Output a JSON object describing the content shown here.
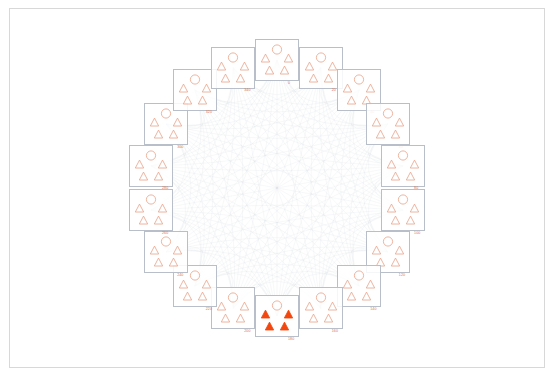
{
  "figure": {
    "title": "",
    "background_color": "#ffffff",
    "frame_color": "#d8d8d8",
    "edge_color": "#c9ced6",
    "node_border_color": "#b9bfc9",
    "glyph_outline_color": "#e8a288",
    "glyph_fill_color": "#f4460d",
    "label_color": "#e2704f",
    "layout": "circular",
    "node_count": 18,
    "glyphs_per_node": {
      "circles": 1,
      "triangles": 4
    }
  },
  "chart_data": {
    "type": "diagram",
    "nodes": [
      {
        "id": 0,
        "label": "0",
        "angle_deg": 0,
        "highlighted": false,
        "circles": 1,
        "triangles": 4,
        "filled_triangles": 0
      },
      {
        "id": 1,
        "label": "20",
        "angle_deg": 20,
        "highlighted": false,
        "circles": 1,
        "triangles": 4,
        "filled_triangles": 0
      },
      {
        "id": 2,
        "label": "40",
        "angle_deg": 40,
        "highlighted": false,
        "circles": 1,
        "triangles": 4,
        "filled_triangles": 0
      },
      {
        "id": 3,
        "label": "60",
        "angle_deg": 60,
        "highlighted": false,
        "circles": 1,
        "triangles": 4,
        "filled_triangles": 0
      },
      {
        "id": 4,
        "label": "80",
        "angle_deg": 80,
        "highlighted": false,
        "circles": 1,
        "triangles": 4,
        "filled_triangles": 0
      },
      {
        "id": 5,
        "label": "100",
        "angle_deg": 100,
        "highlighted": false,
        "circles": 1,
        "triangles": 4,
        "filled_triangles": 0
      },
      {
        "id": 6,
        "label": "120",
        "angle_deg": 120,
        "highlighted": false,
        "circles": 1,
        "triangles": 4,
        "filled_triangles": 0
      },
      {
        "id": 7,
        "label": "140",
        "angle_deg": 140,
        "highlighted": false,
        "circles": 1,
        "triangles": 4,
        "filled_triangles": 0
      },
      {
        "id": 8,
        "label": "160",
        "angle_deg": 160,
        "highlighted": false,
        "circles": 1,
        "triangles": 4,
        "filled_triangles": 0
      },
      {
        "id": 9,
        "label": "180",
        "angle_deg": 180,
        "highlighted": true,
        "circles": 1,
        "triangles": 4,
        "filled_triangles": 4
      },
      {
        "id": 10,
        "label": "200",
        "angle_deg": 200,
        "highlighted": false,
        "circles": 1,
        "triangles": 4,
        "filled_triangles": 0
      },
      {
        "id": 11,
        "label": "220",
        "angle_deg": 220,
        "highlighted": false,
        "circles": 1,
        "triangles": 4,
        "filled_triangles": 0
      },
      {
        "id": 12,
        "label": "240",
        "angle_deg": 240,
        "highlighted": false,
        "circles": 1,
        "triangles": 4,
        "filled_triangles": 0
      },
      {
        "id": 13,
        "label": "260",
        "angle_deg": 260,
        "highlighted": false,
        "circles": 1,
        "triangles": 4,
        "filled_triangles": 0
      },
      {
        "id": 14,
        "label": "280",
        "angle_deg": 280,
        "highlighted": false,
        "circles": 1,
        "triangles": 4,
        "filled_triangles": 0
      },
      {
        "id": 15,
        "label": "300",
        "angle_deg": 300,
        "highlighted": false,
        "circles": 1,
        "triangles": 4,
        "filled_triangles": 0
      },
      {
        "id": 16,
        "label": "320",
        "angle_deg": 320,
        "highlighted": false,
        "circles": 1,
        "triangles": 4,
        "filled_triangles": 0
      },
      {
        "id": 17,
        "label": "340",
        "angle_deg": 340,
        "highlighted": false,
        "circles": 1,
        "triangles": 4,
        "filled_triangles": 0
      }
    ],
    "edges": {
      "style": "curved",
      "color": "#c9ced6",
      "opacity": 0.35,
      "connectivity": "near-complete graph between all 18 nodes"
    },
    "legend": [],
    "xlabel": "",
    "ylabel": ""
  }
}
